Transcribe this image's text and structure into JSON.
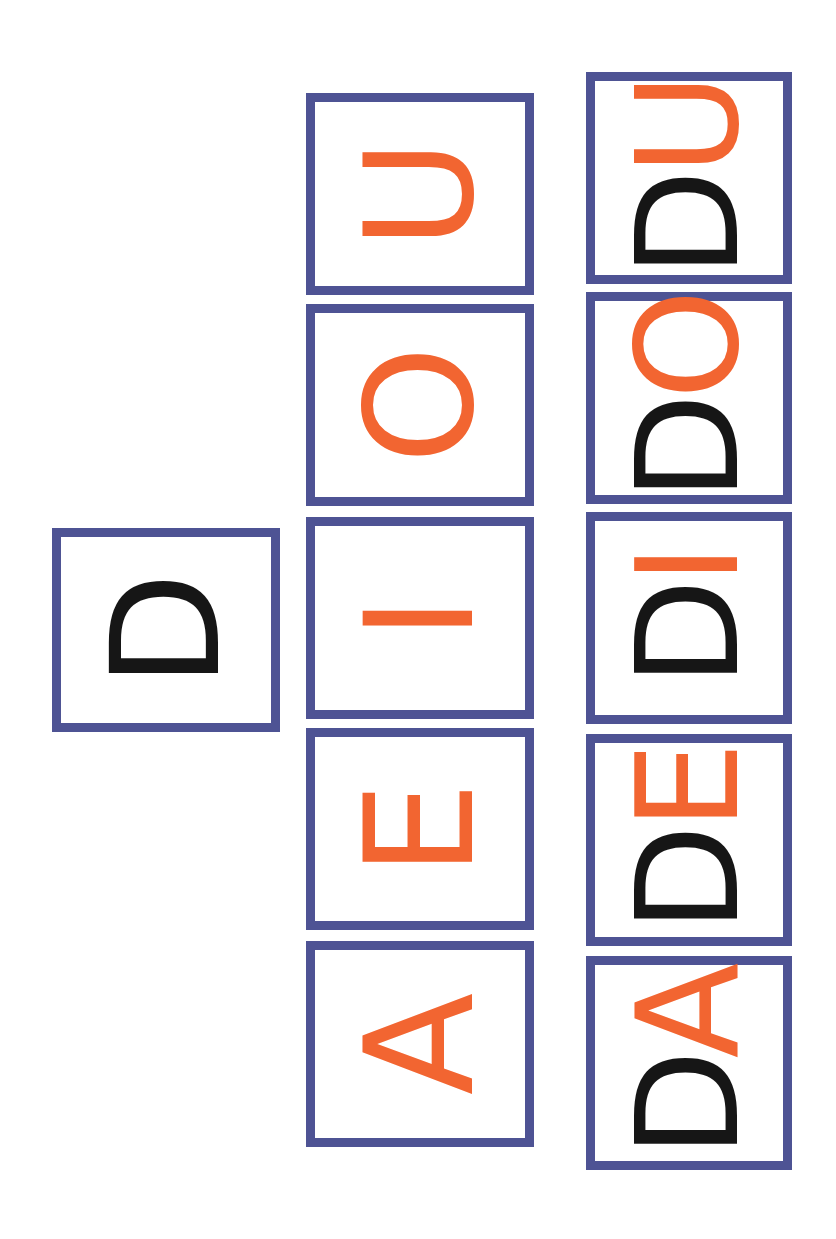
{
  "colors": {
    "border": "#4e5394",
    "consonant": "#161616",
    "vowel": "#f26531",
    "background": "#ffffff"
  },
  "orientation": "text rotated 90deg counter-clockwise",
  "consonant_card": {
    "letter": "D"
  },
  "vowel_cards": [
    {
      "letter": "A"
    },
    {
      "letter": "E"
    },
    {
      "letter": "I"
    },
    {
      "letter": "O"
    },
    {
      "letter": "U"
    }
  ],
  "syllable_cards": [
    {
      "consonant": "D",
      "vowel": "A"
    },
    {
      "consonant": "D",
      "vowel": "E"
    },
    {
      "consonant": "D",
      "vowel": "I"
    },
    {
      "consonant": "D",
      "vowel": "O"
    },
    {
      "consonant": "D",
      "vowel": "U"
    }
  ]
}
